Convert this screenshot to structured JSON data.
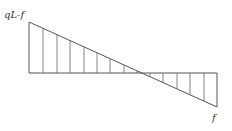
{
  "diagram": {
    "type": "shear-force-diagram",
    "labels": {
      "left_value": "qL-f",
      "right_value": "f"
    },
    "geometry": {
      "baseline_y": 73,
      "left_x": 29,
      "left_top_y": 22,
      "right_x": 217,
      "right_bottom_y": 107,
      "zero_crossing_x": 143
    },
    "hatch_lines_x": [
      43,
      57,
      70,
      84,
      97,
      110,
      124,
      137,
      150,
      163,
      177,
      190,
      204
    ],
    "colors": {
      "line": "#555555",
      "text": "#333333"
    }
  }
}
